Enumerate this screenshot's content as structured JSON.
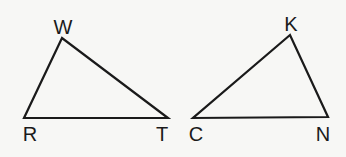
{
  "diagram": {
    "triangles": [
      {
        "name": "triangle-WRT",
        "vertices": [
          {
            "label": "W",
            "x": 62,
            "y": 38,
            "lx": 63,
            "ly": 34
          },
          {
            "label": "R",
            "x": 24,
            "y": 118,
            "lx": 30,
            "ly": 141
          },
          {
            "label": "T",
            "x": 168,
            "y": 118,
            "lx": 162,
            "ly": 141
          }
        ]
      },
      {
        "name": "triangle-KCN",
        "vertices": [
          {
            "label": "K",
            "x": 290,
            "y": 35,
            "lx": 291,
            "ly": 31
          },
          {
            "label": "C",
            "x": 193,
            "y": 118,
            "lx": 196,
            "ly": 141
          },
          {
            "label": "N",
            "x": 328,
            "y": 117,
            "lx": 323,
            "ly": 141
          }
        ]
      }
    ],
    "colors": {
      "stroke": "#1a1a1a",
      "background": "#f7f7f5"
    }
  }
}
